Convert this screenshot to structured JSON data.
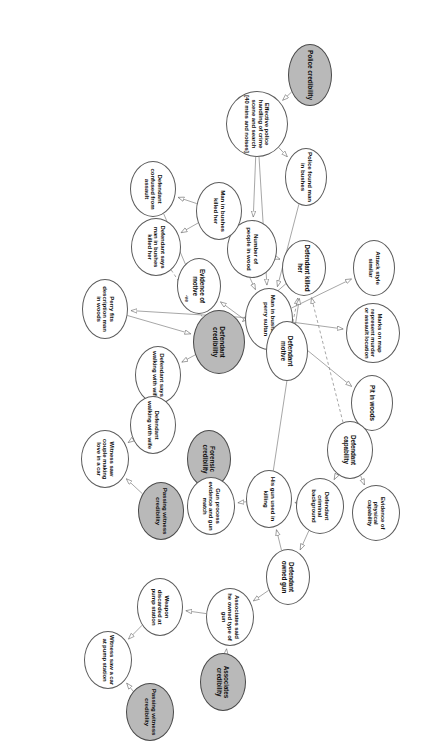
{
  "diagram": {
    "orientation_deg": 90,
    "colors": {
      "node_fill": "#ffffff",
      "node_shaded_fill": "#b9b9b9",
      "node_stroke": "#5c5c5c",
      "edge_stroke": "#8a8a8a",
      "text": "#0d0d0d",
      "background": "#ffffff"
    },
    "nodes": [
      {
        "id": "police_cred",
        "label": "Police credibility",
        "shaded": true,
        "x": 44,
        "y": 96,
        "w": 62,
        "h": 44,
        "fs": 6.5
      },
      {
        "id": "eff_police",
        "label": "Effective police handling of crime scene and search [40 mins and noises]",
        "shaded": false,
        "x": 91,
        "y": 140,
        "w": 66,
        "h": 62,
        "fs": 6.0
      },
      {
        "id": "police_found",
        "label": "Police found man in bushes",
        "shaded": false,
        "x": 148,
        "y": 101,
        "w": 58,
        "h": 42,
        "fs": 6.2
      },
      {
        "id": "attack_style",
        "label": "Attack style similar",
        "shaded": false,
        "x": 240,
        "y": 33,
        "w": 56,
        "h": 42,
        "fs": 6.2
      },
      {
        "id": "marks_map",
        "label": "Marks on map represent murder or assault location",
        "shaded": false,
        "x": 303,
        "y": 28,
        "w": 60,
        "h": 54,
        "fs": 6.0
      },
      {
        "id": "pit_woods",
        "label": "Pit in woods",
        "shaded": false,
        "x": 375,
        "y": 35,
        "w": 56,
        "h": 42,
        "fs": 6.3
      },
      {
        "id": "man_bushes_perry",
        "label": "Man in bushes is perry sultan",
        "shaded": false,
        "x": 288,
        "y": 135,
        "w": 62,
        "h": 48,
        "fs": 6.2
      },
      {
        "id": "num_people",
        "label": "Number of people in wood",
        "shaded": false,
        "x": 220,
        "y": 151,
        "w": 58,
        "h": 50,
        "fs": 6.2
      },
      {
        "id": "evidence_motive",
        "label": "Evidence of motive",
        "shaded": false,
        "x": 258,
        "y": 207,
        "w": 56,
        "h": 44,
        "fs": 6.3
      },
      {
        "id": "man_bushes_killed",
        "label": "Man in bushes killed her",
        "shaded": false,
        "x": 182,
        "y": 186,
        "w": 58,
        "h": 46,
        "fs": 6.2
      },
      {
        "id": "def_says_man",
        "label": "Defendant says man in bushes killed her",
        "shaded": false,
        "x": 218,
        "y": 247,
        "w": 58,
        "h": 50,
        "fs": 6.0
      },
      {
        "id": "def_confused",
        "label": "Defendant confused from assault",
        "shaded": false,
        "x": 161,
        "y": 252,
        "w": 56,
        "h": 46,
        "fs": 6.1
      },
      {
        "id": "perry_fits",
        "label": "Perry fits description man in woods",
        "shaded": false,
        "x": 279,
        "y": 300,
        "w": 60,
        "h": 46,
        "fs": 6.1
      },
      {
        "id": "def_cred",
        "label": "Defendant credibility",
        "shaded": true,
        "x": 310,
        "y": 183,
        "w": 64,
        "h": 52,
        "fs": 6.6
      },
      {
        "id": "def_motive",
        "label": "Defendant motive",
        "shaded": false,
        "x": 321,
        "y": 120,
        "w": 60,
        "h": 42,
        "fs": 6.4
      },
      {
        "id": "def_killed",
        "label": "Defendant killed her",
        "shaded": false,
        "x": 240,
        "y": 102,
        "w": 56,
        "h": 44,
        "fs": 6.3
      },
      {
        "id": "def_says_walking",
        "label": "Defendant says walking with wife",
        "shaded": false,
        "x": 346,
        "y": 247,
        "w": 58,
        "h": 46,
        "fs": 6.1
      },
      {
        "id": "def_walking",
        "label": "Defendant walking with wife",
        "shaded": false,
        "x": 396,
        "y": 252,
        "w": 58,
        "h": 46,
        "fs": 6.1
      },
      {
        "id": "witness_couple",
        "label": "Witness saw couple making love in a car",
        "shaded": false,
        "x": 430,
        "y": 299,
        "w": 58,
        "h": 48,
        "fs": 6.0
      },
      {
        "id": "passing_cred_1",
        "label": "Passing witness credibility",
        "shaded": true,
        "x": 482,
        "y": 244,
        "w": 58,
        "h": 46,
        "fs": 6.2
      },
      {
        "id": "forensic_cred",
        "label": "Forensic credibility",
        "shaded": true,
        "x": 430,
        "y": 197,
        "w": 58,
        "h": 44,
        "fs": 6.4
      },
      {
        "id": "gun_process",
        "label": "Gun process evidence and gun match",
        "shaded": false,
        "x": 477,
        "y": 193,
        "w": 58,
        "h": 48,
        "fs": 6.0
      },
      {
        "id": "his_gun_used",
        "label": "His gun used in killing",
        "shaded": false,
        "x": 470,
        "y": 136,
        "w": 58,
        "h": 46,
        "fs": 6.2
      },
      {
        "id": "def_crim_bg",
        "label": "Defendant criminal background",
        "shaded": false,
        "x": 478,
        "y": 84,
        "w": 56,
        "h": 48,
        "fs": 6.0
      },
      {
        "id": "evidence_phys",
        "label": "Evidence of physical capability",
        "shaded": false,
        "x": 485,
        "y": 28,
        "w": 56,
        "h": 48,
        "fs": 6.0
      },
      {
        "id": "def_capability",
        "label": "Defendant capability",
        "shaded": false,
        "x": 421,
        "y": 55,
        "w": 58,
        "h": 46,
        "fs": 6.3
      },
      {
        "id": "def_owned_gun",
        "label": "Defendant owned gun",
        "shaded": false,
        "x": 549,
        "y": 118,
        "w": 56,
        "h": 44,
        "fs": 6.3
      },
      {
        "id": "assoc_said",
        "label": "Associates said he owned type of gun",
        "shaded": false,
        "x": 588,
        "y": 174,
        "w": 58,
        "h": 48,
        "fs": 6.0
      },
      {
        "id": "assoc_cred",
        "label": "Associates credibility",
        "shaded": true,
        "x": 653,
        "y": 182,
        "w": 58,
        "h": 46,
        "fs": 6.3
      },
      {
        "id": "weapon_discarded",
        "label": "Weapon discarded at pump station",
        "shaded": false,
        "x": 578,
        "y": 245,
        "w": 58,
        "h": 46,
        "fs": 6.1
      },
      {
        "id": "witness_car_pump",
        "label": "Witness saw a car at pump station",
        "shaded": false,
        "x": 631,
        "y": 296,
        "w": 58,
        "h": 48,
        "fs": 6.0
      },
      {
        "id": "passing_cred_2",
        "label": "Passing witness credibility",
        "shaded": true,
        "x": 683,
        "y": 254,
        "w": 58,
        "h": 48,
        "fs": 6.2
      }
    ],
    "edges": [
      {
        "from": "police_cred",
        "to": "eff_police",
        "style": "solid",
        "arrow": true
      },
      {
        "from": "eff_police",
        "to": "police_found",
        "style": "solid",
        "arrow": true
      },
      {
        "from": "eff_police",
        "to": "num_people",
        "style": "solid",
        "arrow": true
      },
      {
        "from": "eff_police",
        "to": "man_bushes_perry",
        "style": "solid",
        "arrow": true
      },
      {
        "from": "police_found",
        "to": "man_bushes_perry",
        "style": "solid",
        "arrow": true
      },
      {
        "from": "man_bushes_perry",
        "to": "attack_style",
        "style": "solid",
        "arrow": true
      },
      {
        "from": "man_bushes_perry",
        "to": "marks_map",
        "style": "solid",
        "arrow": true
      },
      {
        "from": "man_bushes_perry",
        "to": "pit_woods",
        "style": "solid",
        "arrow": true
      },
      {
        "from": "man_bushes_perry",
        "to": "perry_fits",
        "style": "solid",
        "arrow": true
      },
      {
        "from": "num_people",
        "to": "man_bushes_killed",
        "style": "solid",
        "arrow": true
      },
      {
        "from": "num_people",
        "to": "def_killed",
        "style": "solid",
        "arrow": true
      },
      {
        "from": "def_motive",
        "to": "evidence_motive",
        "style": "solid",
        "arrow": true
      },
      {
        "from": "def_motive",
        "to": "def_killed",
        "style": "dashed",
        "arrow": true
      },
      {
        "from": "def_capability",
        "to": "def_killed",
        "style": "dashed",
        "arrow": true
      },
      {
        "from": "man_bushes_killed",
        "to": "def_says_man",
        "style": "solid",
        "arrow": true
      },
      {
        "from": "man_bushes_killed",
        "to": "def_confused",
        "style": "solid",
        "arrow": true
      },
      {
        "from": "man_bushes_killed",
        "to": "man_bushes_perry",
        "style": "solid",
        "arrow": true
      },
      {
        "from": "def_says_man",
        "to": "def_cred",
        "style": "dashed",
        "arrow": false,
        "label": "-ve"
      },
      {
        "from": "def_confused",
        "to": "def_cred",
        "style": "solid",
        "arrow": true
      },
      {
        "from": "def_killed",
        "to": "def_cred",
        "style": "solid",
        "arrow": true
      },
      {
        "from": "perry_fits",
        "to": "def_cred",
        "style": "solid",
        "arrow": true
      },
      {
        "from": "def_cred",
        "to": "def_says_walking",
        "style": "solid",
        "arrow": true
      },
      {
        "from": "def_says_walking",
        "to": "def_walking",
        "style": "solid",
        "arrow": true
      },
      {
        "from": "def_walking",
        "to": "witness_couple",
        "style": "solid",
        "arrow": true
      },
      {
        "from": "passing_cred_1",
        "to": "witness_couple",
        "style": "solid",
        "arrow": true
      },
      {
        "from": "forensic_cred",
        "to": "gun_process",
        "style": "solid",
        "arrow": true
      },
      {
        "from": "his_gun_used",
        "to": "gun_process",
        "style": "solid",
        "arrow": true
      },
      {
        "from": "his_gun_used",
        "to": "def_killed",
        "style": "solid",
        "arrow": true
      },
      {
        "from": "def_owned_gun",
        "to": "his_gun_used",
        "style": "solid",
        "arrow": true
      },
      {
        "from": "def_crim_bg",
        "to": "his_gun_used",
        "style": "solid",
        "arrow": true
      },
      {
        "from": "def_capability",
        "to": "evidence_phys",
        "style": "solid",
        "arrow": true
      },
      {
        "from": "def_capability",
        "to": "def_crim_bg",
        "style": "solid",
        "arrow": true
      },
      {
        "from": "def_crim_bg",
        "to": "def_owned_gun",
        "style": "solid",
        "arrow": true
      },
      {
        "from": "def_owned_gun",
        "to": "assoc_said",
        "style": "solid",
        "arrow": true
      },
      {
        "from": "assoc_cred",
        "to": "assoc_said",
        "style": "solid",
        "arrow": true
      },
      {
        "from": "assoc_said",
        "to": "weapon_discarded",
        "style": "solid",
        "arrow": true
      },
      {
        "from": "weapon_discarded",
        "to": "witness_car_pump",
        "style": "solid",
        "arrow": true
      },
      {
        "from": "passing_cred_2",
        "to": "witness_car_pump",
        "style": "solid",
        "arrow": true
      }
    ]
  }
}
